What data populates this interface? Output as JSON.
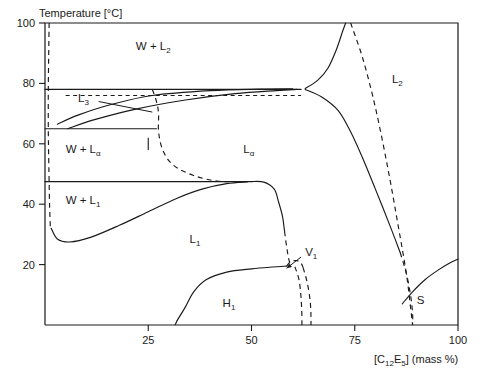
{
  "chart_data": {
    "type": "line",
    "title": "",
    "subtitle": "",
    "ylabel": "Temperature [°C]",
    "xlabel_parts": {
      "open": "[C",
      "sub1": "12",
      "mid": "E",
      "sub2": "5",
      "close": "] (mass %)"
    },
    "xlabel": "[C12E5] (mass %)",
    "grid": false,
    "legend_position": "none",
    "xlim": [
      0,
      100
    ],
    "ylim": [
      0,
      100
    ],
    "xticks": [
      25,
      50,
      75,
      100
    ],
    "xtick_labels": [
      "25",
      "50",
      "75",
      "100"
    ],
    "yticks": [
      20,
      40,
      60,
      80,
      100
    ],
    "ytick_labels": [
      "20",
      "40",
      "60",
      "80",
      "100"
    ],
    "region_labels": [
      {
        "name": "w-plus-l2",
        "text": "W + L",
        "sub": "2",
        "x": 22,
        "y": 91
      },
      {
        "name": "l3",
        "text": "L",
        "sub": "3",
        "x": 8,
        "y": 74
      },
      {
        "name": "w-plus-lalpha",
        "text": "W + L",
        "sub": "α",
        "x": 5,
        "y": 57
      },
      {
        "name": "w-plus-l1",
        "text": "W + L",
        "sub": "1",
        "x": 5,
        "y": 40
      },
      {
        "name": "lalpha",
        "text": "L",
        "sub": "α",
        "x": 48,
        "y": 57
      },
      {
        "name": "l2",
        "text": "L",
        "sub": "2",
        "x": 84,
        "y": 80
      },
      {
        "name": "l1",
        "text": "L",
        "sub": "1",
        "x": 35,
        "y": 27
      },
      {
        "name": "h1",
        "text": "H",
        "sub": "1",
        "x": 43,
        "y": 6
      },
      {
        "name": "v1",
        "text": "V",
        "sub": "1",
        "x": 63,
        "y": 23
      },
      {
        "name": "s",
        "text": "S",
        "sub": "",
        "x": 90,
        "y": 7
      }
    ],
    "horizontal_boundaries": [
      {
        "name": "three-phase-line-78",
        "temperature": 78,
        "x_from": 0,
        "x_to": 62,
        "style": "solid"
      },
      {
        "name": "dashed-line-76",
        "temperature": 76,
        "x_from": 5,
        "x_to": 62,
        "style": "dashed"
      },
      {
        "name": "three-phase-line-65",
        "temperature": 65,
        "x_from": 0,
        "x_to": 27,
        "style": "solid"
      },
      {
        "name": "three-phase-line-47",
        "temperature": 47.5,
        "x_from": 0,
        "x_to": 50,
        "style": "solid"
      }
    ],
    "series": [
      {
        "name": "water-solubility-left-dashed",
        "style": "dashed",
        "points": [
          [
            1.0,
            100
          ],
          [
            0.9,
            90
          ],
          [
            0.8,
            78
          ],
          [
            0.8,
            65
          ],
          [
            0.9,
            55
          ],
          [
            1.0,
            47.5
          ],
          [
            1.1,
            40
          ],
          [
            1.3,
            32
          ]
        ]
      },
      {
        "name": "l3-lens-upper",
        "style": "solid",
        "points": [
          [
            3.0,
            66.5
          ],
          [
            8,
            69.5
          ],
          [
            16,
            73
          ],
          [
            26,
            76
          ],
          [
            40,
            77.6
          ],
          [
            52,
            78.1
          ],
          [
            60,
            78.2
          ]
        ]
      },
      {
        "name": "l3-lens-lower",
        "style": "solid",
        "points": [
          [
            5.5,
            65.0
          ],
          [
            12,
            68
          ],
          [
            22,
            71.5
          ],
          [
            34,
            74.5
          ],
          [
            46,
            76.6
          ],
          [
            56,
            77.6
          ],
          [
            61,
            78.0
          ]
        ]
      },
      {
        "name": "lalpha-left-dashed-boundary",
        "style": "dashed",
        "points": [
          [
            26,
            78
          ],
          [
            27,
            74
          ],
          [
            27.5,
            70
          ],
          [
            27.5,
            64
          ],
          [
            28.5,
            58
          ],
          [
            31,
            53
          ],
          [
            36,
            49.5
          ],
          [
            42,
            47.6
          ],
          [
            48,
            47.5
          ]
        ]
      },
      {
        "name": "lalpha-to-l2-upper-critical",
        "style": "solid",
        "points": [
          [
            63,
            78.3
          ],
          [
            66,
            81
          ],
          [
            68.5,
            85
          ],
          [
            70.5,
            91
          ],
          [
            72,
            97
          ],
          [
            72.8,
            100
          ]
        ]
      },
      {
        "name": "lalpha-to-l2-lower",
        "style": "solid",
        "points": [
          [
            63,
            78.0
          ],
          [
            67,
            75.5
          ],
          [
            71,
            71
          ],
          [
            74,
            64
          ],
          [
            77,
            55
          ],
          [
            80,
            45
          ],
          [
            83.5,
            33
          ],
          [
            86,
            24
          ]
        ]
      },
      {
        "name": "l2-right-dashed",
        "style": "dashed",
        "points": [
          [
            86,
            24
          ],
          [
            87.5,
            17
          ],
          [
            88.5,
            10
          ],
          [
            89,
            4
          ],
          [
            89,
            0
          ]
        ]
      },
      {
        "name": "w-l1-phase-boundary",
        "style": "solid",
        "points": [
          [
            1.5,
            32
          ],
          [
            3,
            28.5
          ],
          [
            6,
            27.5
          ],
          [
            11,
            29
          ],
          [
            18,
            33
          ],
          [
            25,
            37.5
          ],
          [
            32,
            42
          ],
          [
            38,
            45
          ],
          [
            44,
            46.8
          ],
          [
            49,
            47.4
          ]
        ]
      },
      {
        "name": "lalpha-lower-right-shoulder",
        "style": "solid",
        "points": [
          [
            50,
            47.5
          ],
          [
            53,
            47.3
          ],
          [
            55.5,
            45
          ],
          [
            56.5,
            41
          ],
          [
            57.5,
            36
          ],
          [
            58,
            31
          ]
        ]
      },
      {
        "name": "lalpha-lower-right-dashed",
        "style": "dashed",
        "points": [
          [
            58,
            31
          ],
          [
            58.5,
            26
          ],
          [
            59,
            22
          ],
          [
            59.5,
            19.5
          ]
        ]
      },
      {
        "name": "h1-upper-boundary",
        "style": "solid",
        "points": [
          [
            32,
            1.5
          ],
          [
            34,
            6
          ],
          [
            36,
            11
          ],
          [
            39,
            15
          ],
          [
            44,
            17.5
          ],
          [
            50,
            18.6
          ],
          [
            55,
            19.2
          ],
          [
            58.5,
            19.5
          ]
        ]
      },
      {
        "name": "h1-lower-left-dashed",
        "style": "dashed",
        "points": [
          [
            32,
            1.5
          ],
          [
            31.5,
            0
          ]
        ]
      },
      {
        "name": "v1-cusp-bump",
        "style": "dashed",
        "points": [
          [
            58.5,
            19.5
          ],
          [
            59.5,
            21
          ],
          [
            61,
            21.3
          ],
          [
            62,
            20.5
          ],
          [
            62.5,
            19
          ]
        ]
      },
      {
        "name": "v1-left-leg",
        "style": "dashed",
        "points": [
          [
            60.5,
            19.3
          ],
          [
            61.5,
            15
          ],
          [
            62,
            9
          ],
          [
            62.2,
            3
          ],
          [
            62.2,
            0
          ]
        ]
      },
      {
        "name": "v1-right-leg",
        "style": "dashed",
        "points": [
          [
            62.5,
            19
          ],
          [
            63.5,
            14
          ],
          [
            64.2,
            8
          ],
          [
            64.4,
            3
          ],
          [
            64.4,
            0
          ]
        ]
      },
      {
        "name": "s-solidus-dashed",
        "style": "dashed",
        "points": [
          [
            74,
            100
          ],
          [
            77,
            88
          ],
          [
            80,
            72
          ],
          [
            83,
            52
          ],
          [
            85.5,
            33
          ],
          [
            87.5,
            17
          ],
          [
            88.5,
            6
          ],
          [
            89,
            0
          ]
        ]
      },
      {
        "name": "s-liquidus-solid",
        "style": "solid",
        "points": [
          [
            86.5,
            7
          ],
          [
            89,
            11
          ],
          [
            92,
            15
          ],
          [
            95,
            18
          ],
          [
            98,
            20.5
          ],
          [
            100,
            21.8
          ]
        ]
      }
    ],
    "annotations": [
      {
        "name": "l3-pointer",
        "label": "L3",
        "from": [
          13,
          74
        ],
        "to": [
          26,
          70.5
        ]
      },
      {
        "name": "v1-pointer",
        "label": "V1",
        "from": [
          62,
          22.5
        ],
        "to": [
          58.5,
          18.8
        ]
      },
      {
        "name": "tie-line-65",
        "label": "",
        "from": [
          0,
          65
        ],
        "to": [
          27,
          65
        ]
      }
    ]
  }
}
